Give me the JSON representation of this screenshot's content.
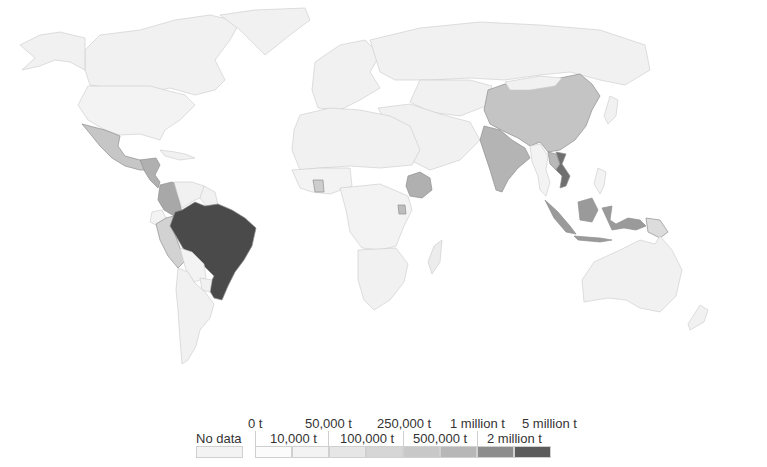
{
  "map": {
    "type": "choropleth",
    "unit": "t",
    "highlighted_regions": [
      {
        "name": "Brazil",
        "bin": "2 million t – 5 million t",
        "color": "#4a4a4a"
      },
      {
        "name": "Vietnam",
        "bin": "1 million t – 2 million t",
        "color": "#7a7a7a"
      },
      {
        "name": "Colombia",
        "bin": "500,000 t – 1 million t",
        "color": "#a8a8a8"
      },
      {
        "name": "Indonesia",
        "bin": "500,000 t – 1 million t",
        "color": "#9a9a9a"
      },
      {
        "name": "Ethiopia",
        "bin": "250,000 t – 500,000 t",
        "color": "#b0b0b0"
      },
      {
        "name": "India",
        "bin": "250,000 t – 500,000 t",
        "color": "#b4b4b4"
      },
      {
        "name": "China",
        "bin": "100,000 t – 250,000 t",
        "color": "#c4c4c4"
      },
      {
        "name": "Mexico",
        "bin": "100,000 t – 250,000 t",
        "color": "#c6c6c6"
      },
      {
        "name": "Peru",
        "bin": "100,000 t – 250,000 t",
        "color": "#d2d2d2"
      },
      {
        "name": "Uganda",
        "bin": "100,000 t – 250,000 t",
        "color": "#bdbdbd"
      },
      {
        "name": "Honduras",
        "bin": "250,000 t – 500,000 t",
        "color": "#b0b0b0"
      },
      {
        "name": "Cote d'Ivoire",
        "bin": "50,000 t – 100,000 t",
        "color": "#cdcdcd"
      },
      {
        "name": "Laos",
        "bin": "100,000 t – 250,000 t",
        "color": "#b8b8b8"
      },
      {
        "name": "Papua New Guinea",
        "bin": "50,000 t – 100,000 t",
        "color": "#dcdcdc"
      }
    ],
    "default_color": "#f1f1f1",
    "water_color": "#ffffff"
  },
  "legend": {
    "no_data_label": "No data",
    "no_data_color": "#f3f3f3",
    "top_labels": [
      "0 t",
      "50,000 t",
      "250,000 t",
      "1 million t",
      "5 million t"
    ],
    "bottom_labels": [
      "10,000 t",
      "100,000 t",
      "500,000 t",
      "2 million t"
    ],
    "swatch_colors": [
      "#fbfbfb",
      "#f3f3f3",
      "#e6e6e6",
      "#d6d6d6",
      "#c8c8c8",
      "#b7b7b7",
      "#8d8d8d",
      "#5c5c5c"
    ]
  }
}
